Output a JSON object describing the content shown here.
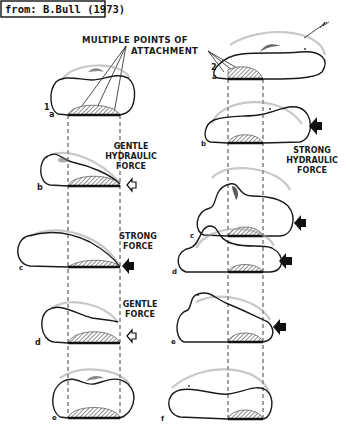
{
  "source_label": "from: B.Bull (1973)",
  "annotation": {
    "line1": "MULTIPLE POINTS OF",
    "line2": "ATTACHMENT"
  },
  "series": [
    {
      "number": "1",
      "stages": [
        {
          "letter": "a",
          "force": null
        },
        {
          "letter": "b",
          "force": {
            "label_lines": [
              "GENTLE",
              "HYDRAULIC",
              "FORCE"
            ],
            "arrow": "open"
          }
        },
        {
          "letter": "c",
          "force": {
            "label_lines": [
              "STRONG",
              "FORCE"
            ],
            "arrow": "solid"
          }
        },
        {
          "letter": "d",
          "force": {
            "label_lines": [
              "GENTLE",
              "FORCE"
            ],
            "arrow": "open"
          }
        },
        {
          "letter": "e",
          "force": null
        }
      ]
    },
    {
      "number": "2",
      "stages": [
        {
          "letter": "a",
          "force": null
        },
        {
          "letter": "b",
          "force": {
            "label_lines": [
              "STRONG",
              "HYDRAULIC",
              "FORCE"
            ],
            "arrow": "solid"
          }
        },
        {
          "letter": "c",
          "force": {
            "arrow": "solid"
          }
        },
        {
          "letter": "d",
          "force": {
            "arrow": "solid"
          }
        },
        {
          "letter": "e",
          "force": {
            "arrow": "solid"
          }
        },
        {
          "letter": "f",
          "force": null
        }
      ]
    }
  ],
  "labels": {
    "s1": "1",
    "s1a": "a",
    "s1b": "b",
    "s1c": "c",
    "s1d": "d",
    "s1e": "e",
    "s2": "2",
    "s2a": "a",
    "s2b": "b",
    "s2c": "c",
    "s2d": "d",
    "s2e": "e",
    "s2f": "f",
    "gentle_hydraulic": [
      "GENTLE",
      "HYDRAULIC",
      "FORCE"
    ],
    "strong_force": [
      "STRONG",
      "FORCE"
    ],
    "gentle_force": [
      "GENTLE",
      "FORCE"
    ],
    "strong_hydraulic": [
      "STRONG",
      "HYDRAULIC",
      "FORCE"
    ]
  },
  "colors": {
    "ink": "#1a1a1a",
    "background": "#ffffff",
    "ghost": "#9a9a9a"
  }
}
